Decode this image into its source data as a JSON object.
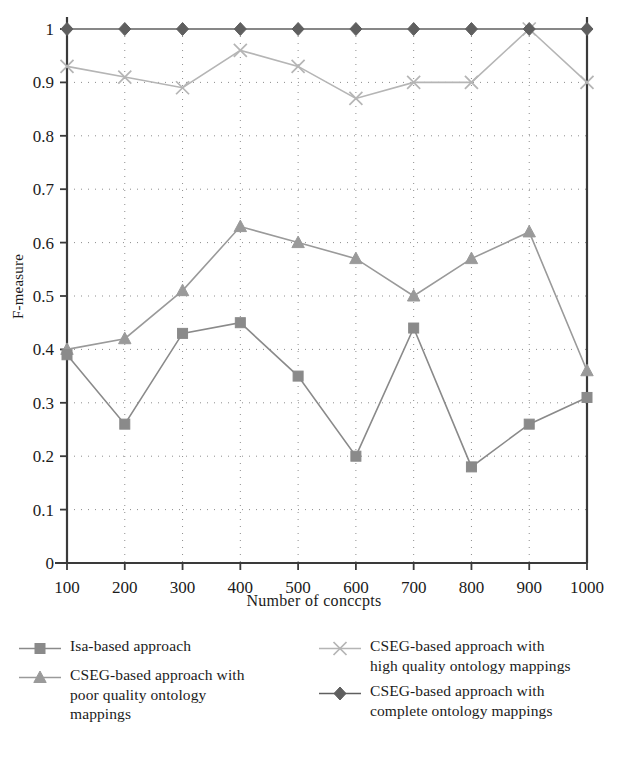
{
  "chart": {
    "type": "line",
    "xlabel": "Number of conccpts",
    "ylabel": "F-measure",
    "ylim": [
      0,
      1
    ],
    "xlim": [
      100,
      1000
    ],
    "yticks": [
      "0",
      "0.1",
      "0.2",
      "0.3",
      "0.4",
      "0.5",
      "0.6",
      "0.7",
      "0.8",
      "0.9",
      "1"
    ],
    "xticks": [
      "100",
      "200",
      "300",
      "400",
      "500",
      "600",
      "700",
      "800",
      "900",
      "1000"
    ],
    "grid": "dotted",
    "legend_position": "below-plot-two-columns"
  },
  "chart_data": {
    "type": "line",
    "title": "",
    "xlabel": "Number of conccpts",
    "ylabel": "F-measure",
    "xlim": [
      100,
      1000
    ],
    "ylim": [
      0,
      1
    ],
    "grid": true,
    "legend_position": "bottom",
    "x": [
      100,
      200,
      300,
      400,
      500,
      600,
      700,
      800,
      900,
      1000
    ],
    "categories": [
      "100",
      "200",
      "300",
      "400",
      "500",
      "600",
      "700",
      "800",
      "900",
      "1000"
    ],
    "series": [
      {
        "name": "Isa-based approach",
        "marker": "square",
        "color": "#8a8a8a",
        "values": [
          0.39,
          0.26,
          0.43,
          0.45,
          0.35,
          0.2,
          0.44,
          0.18,
          0.26,
          0.31
        ]
      },
      {
        "name": "CSEG-based approach with poor quality ontology mappings",
        "marker": "triangle",
        "color": "#9a9a9a",
        "values": [
          0.4,
          0.42,
          0.51,
          0.63,
          0.6,
          0.57,
          0.5,
          0.57,
          0.62,
          0.36
        ]
      },
      {
        "name": "CSEG-based approach with high quality ontology mappings",
        "marker": "cross",
        "color": "#b5b5b5",
        "values": [
          0.93,
          0.91,
          0.89,
          0.96,
          0.93,
          0.87,
          0.9,
          0.9,
          1.0,
          0.9
        ]
      },
      {
        "name": "CSEG-based approach with complete ontology mappings",
        "marker": "diamond",
        "color": "#5f5f5f",
        "values": [
          1.0,
          1.0,
          1.0,
          1.0,
          1.0,
          1.0,
          1.0,
          1.0,
          1.0,
          1.0
        ]
      }
    ]
  },
  "legend": {
    "left": [
      {
        "marker": "square",
        "label": "Isa-based approach"
      },
      {
        "marker": "triangle",
        "label": "CSEG-based approach with\npoor quality ontology\nmappings"
      }
    ],
    "right": [
      {
        "marker": "cross",
        "label": "CSEG-based approach with\nhigh quality ontology mappings"
      },
      {
        "marker": "diamond",
        "label": "CSEG-based approach with\ncomplete ontology mappings"
      }
    ]
  }
}
